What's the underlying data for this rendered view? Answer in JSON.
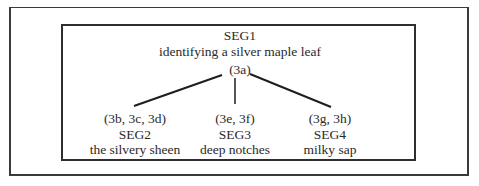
{
  "diagram": {
    "type": "tree",
    "root": {
      "id": "SEG1",
      "label": "SEG1",
      "description": "identifying a silver maple leaf",
      "refs": "(3a)"
    },
    "children": [
      {
        "id": "SEG2",
        "refs": "(3b, 3c, 3d)",
        "label": "SEG2",
        "description": "the silvery sheen"
      },
      {
        "id": "SEG3",
        "refs": "(3e, 3f)",
        "label": "SEG3",
        "description": "deep notches"
      },
      {
        "id": "SEG4",
        "refs": "(3g, 3h)",
        "label": "SEG4",
        "description": "milky sap"
      }
    ],
    "edges": [
      {
        "from": "SEG1",
        "to": "SEG2"
      },
      {
        "from": "SEG1",
        "to": "SEG3"
      },
      {
        "from": "SEG1",
        "to": "SEG4"
      }
    ]
  },
  "colors": {
    "text": "#2a2a2a",
    "lines": "#1e1e1e",
    "background": "#ffffff"
  }
}
